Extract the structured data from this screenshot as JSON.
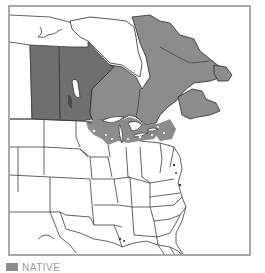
{
  "map": {
    "type": "species distribution range map",
    "region": "North America (Canada and United States)",
    "colors": {
      "background": "#ffffff",
      "frame": "#a8a8a8",
      "boundary": "#3a3a3a",
      "native_dark": "#6f6f6f",
      "native": "#8c8c8c",
      "water": "#ffffff"
    },
    "highlighted_regions": [
      {
        "name": "Saskatchewan",
        "shade": "native_dark"
      },
      {
        "name": "Manitoba",
        "shade": "native_dark"
      },
      {
        "name": "Ontario",
        "shade": "native"
      },
      {
        "name": "Quebec",
        "shade": "native"
      },
      {
        "name": "Labrador / Newfoundland",
        "shade": "native"
      },
      {
        "name": "Maritime provinces",
        "shade": "native"
      },
      {
        "name": "Great Lakes states (counties)",
        "shade": "native"
      },
      {
        "name": "Northeastern states (counties)",
        "shade": "native"
      }
    ]
  },
  "legend": {
    "items": [
      {
        "label": "NATIVE",
        "color": "#8c8c8c"
      }
    ]
  }
}
